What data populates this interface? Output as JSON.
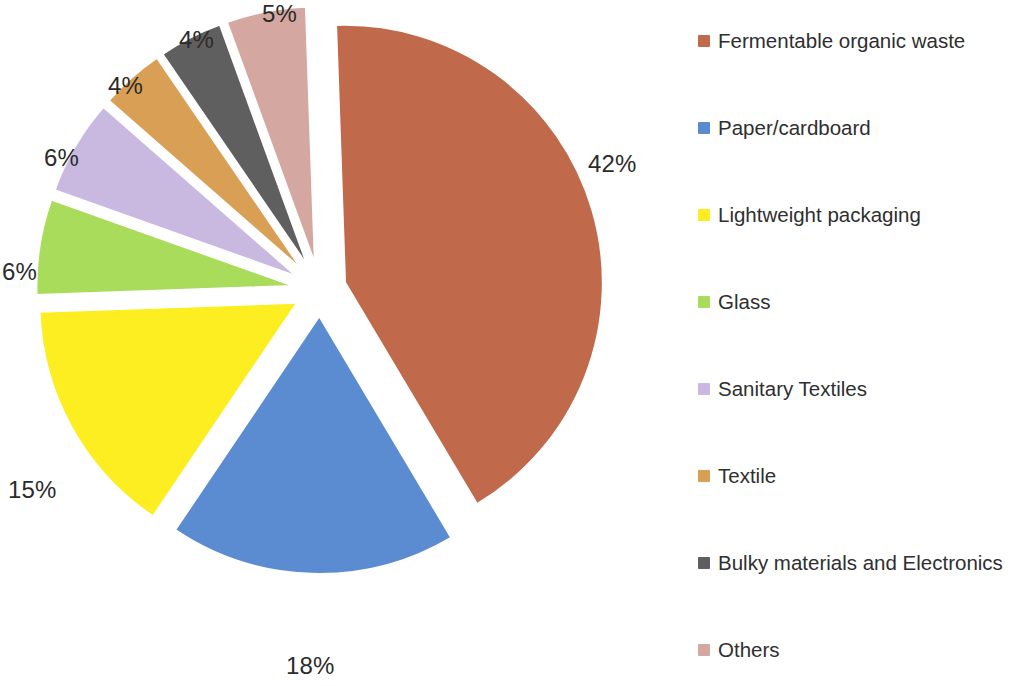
{
  "chart_data": {
    "type": "pie",
    "title": "",
    "subtitle": "",
    "xlabel": "",
    "ylabel": "",
    "grid": false,
    "legend_position": "right",
    "exploded": true,
    "value_unit": "%",
    "categories": [
      "Fermentable organic waste",
      "Paper/cardboard",
      "Lightweight packaging",
      "Glass",
      "Sanitary Textiles",
      "Textile",
      "Bulky materials and Electronics",
      "Others"
    ],
    "values": [
      42,
      18,
      15,
      6,
      6,
      4,
      4,
      5
    ],
    "data_labels": [
      "42%",
      "18%",
      "15%",
      "6%",
      "6%",
      "4%",
      "4%",
      "5%"
    ],
    "colors": [
      "#C0694B",
      "#5B8BD0",
      "#FCEE21",
      "#A8DC5A",
      "#C9B8E0",
      "#D9A055",
      "#5F5F5F",
      "#D4A8A0"
    ],
    "slices": [
      {
        "label": "Fermentable organic waste",
        "value": 42,
        "data_label": "42%",
        "color": "#C0694B"
      },
      {
        "label": "Paper/cardboard",
        "value": 18,
        "data_label": "18%",
        "color": "#5B8BD0"
      },
      {
        "label": "Lightweight packaging",
        "value": 15,
        "data_label": "15%",
        "color": "#FCEE21"
      },
      {
        "label": "Glass",
        "value": 6,
        "data_label": "6%",
        "color": "#A8DC5A"
      },
      {
        "label": "Sanitary Textiles",
        "value": 6,
        "data_label": "6%",
        "color": "#C9B8E0"
      },
      {
        "label": "Textile",
        "value": 4,
        "data_label": "4%",
        "color": "#D9A055"
      },
      {
        "label": "Bulky materials and Electronics",
        "value": 4,
        "data_label": "4%",
        "color": "#5F5F5F"
      },
      {
        "label": "Others",
        "value": 5,
        "data_label": "5%",
        "color": "#D4A8A0"
      }
    ]
  },
  "pie": {
    "labels": [
      {
        "text": "42%",
        "x": 588,
        "y": 152
      },
      {
        "text": "18%",
        "x": 286,
        "y": 654
      },
      {
        "text": "15%",
        "x": 8,
        "y": 478
      },
      {
        "text": "6%",
        "x": 2,
        "y": 260
      },
      {
        "text": "6%",
        "x": 44,
        "y": 146
      },
      {
        "text": "4%",
        "x": 108,
        "y": 74
      },
      {
        "text": "4%",
        "x": 179,
        "y": 28
      },
      {
        "text": "5%",
        "x": 262,
        "y": 2
      }
    ]
  },
  "legend": {
    "items": [
      {
        "label": "Fermentable organic waste",
        "color": "#C0694B",
        "y": 30
      },
      {
        "label": "Paper/cardboard",
        "color": "#5B8BD0",
        "y": 117
      },
      {
        "label": "Lightweight packaging",
        "color": "#FCEE21",
        "y": 204
      },
      {
        "label": "Glass",
        "color": "#A8DC5A",
        "y": 291
      },
      {
        "label": "Sanitary Textiles",
        "color": "#C9B8E0",
        "y": 378
      },
      {
        "label": "Textile",
        "color": "#D9A055",
        "y": 465
      },
      {
        "label": "Bulky materials and Electronics",
        "color": "#5F5F5F",
        "y": 552
      },
      {
        "label": "Others",
        "color": "#D4A8A0",
        "y": 639
      }
    ]
  }
}
